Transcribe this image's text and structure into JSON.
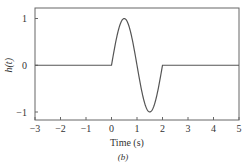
{
  "chart_data": {
    "type": "line",
    "title": "",
    "xlabel": "Time (s)",
    "ylabel": "h(t)",
    "caption": "(b)",
    "xlim": [
      -3,
      5
    ],
    "ylim": [
      -1.2,
      1.2
    ],
    "xticks": [
      -3,
      -2,
      -1,
      0,
      1,
      2,
      3,
      4,
      5
    ],
    "xtick_labels": [
      "−3",
      "−2",
      "−1",
      "0",
      "1",
      "2",
      "3",
      "4",
      "5"
    ],
    "yticks": [
      1,
      0,
      -1
    ],
    "ytick_labels": [
      "1",
      "0",
      "−1"
    ],
    "grid": false,
    "series": [
      {
        "name": "h(t)",
        "description": "sin(pi t) for 0 <= t <= 2, zero elsewhere",
        "x": [
          -3,
          0,
          0.25,
          0.5,
          0.75,
          1,
          1.25,
          1.5,
          1.75,
          2,
          5
        ],
        "values": [
          0,
          0,
          0.707,
          1,
          0.707,
          0,
          -0.707,
          -1,
          -0.707,
          0,
          0
        ],
        "color": "#555555"
      }
    ]
  }
}
